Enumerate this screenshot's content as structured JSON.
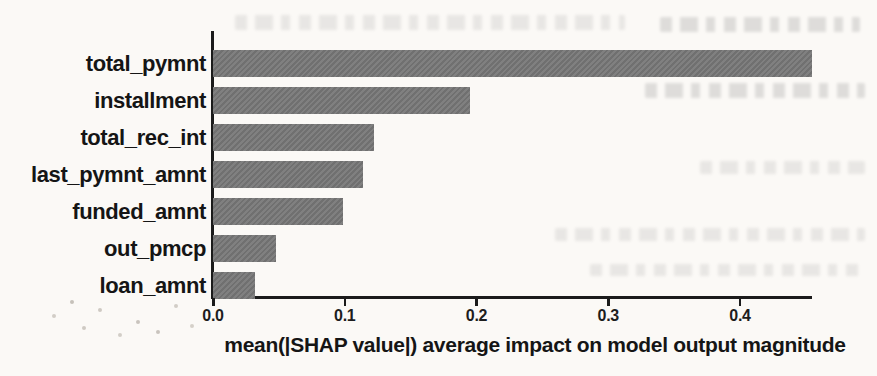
{
  "chart_data": {
    "type": "bar",
    "orientation": "horizontal",
    "title": "",
    "xlabel": "mean(|SHAP value|) average impact on model output magnitude",
    "categories": [
      "total_pymnt",
      "installment",
      "total_rec_int",
      "last_pymnt_amnt",
      "funded_amnt",
      "out_pmcp",
      "loan_amnt"
    ],
    "values": [
      0.455,
      0.195,
      0.122,
      0.114,
      0.099,
      0.048,
      0.032
    ],
    "xlim": [
      0,
      0.46
    ],
    "x_tick_values": [
      0,
      0.1,
      0.2,
      0.3,
      0.4
    ],
    "x_tick_labels": [
      "0.0",
      "0.1",
      "0.2",
      "0.3",
      "0.4"
    ],
    "grid": false,
    "legend": false,
    "bar_color": "#787878",
    "axis_color": "#1b1b1b",
    "text_color": "#151515",
    "background_color": "#fbf9f6"
  }
}
